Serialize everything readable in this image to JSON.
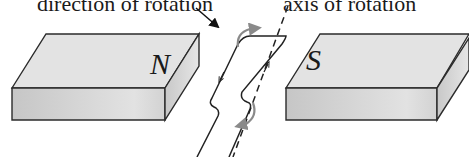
{
  "figure": {
    "type": "generator-coil-diagram",
    "labels": {
      "direction_of_rotation": "direction of rotation",
      "axis_of_rotation": "axis of rotation"
    },
    "magnets": [
      {
        "id": "north",
        "pole": "N"
      },
      {
        "id": "south",
        "pole": "S"
      }
    ],
    "colors": {
      "outline": "#2b2b2b",
      "top_face": "#e4e4e4",
      "front_face": "#cfcfcf",
      "side_face": "#d8d8d8",
      "rotation_arrow": "#8a8a8a",
      "background": "#ffffff"
    }
  }
}
